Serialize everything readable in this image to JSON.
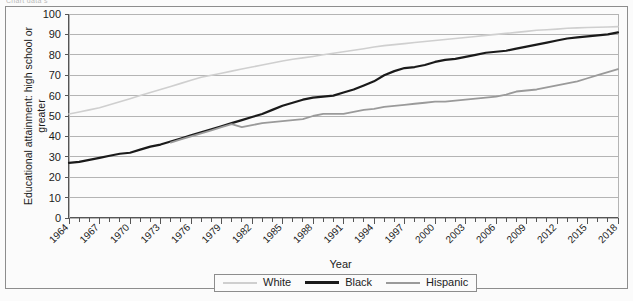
{
  "page": {
    "top_cut_text": "Chart data s"
  },
  "chart_data": {
    "type": "line",
    "title": "",
    "xlabel": "Year",
    "ylabel": "Educational attainment: high school or greater",
    "xlim": [
      1964,
      2018
    ],
    "ylim": [
      0,
      100
    ],
    "ytick_step": 10,
    "xtick_step": 1,
    "xtick_label_step": 3,
    "grid": true,
    "legend_position": "bottom",
    "yticks": [
      0,
      10,
      20,
      30,
      40,
      50,
      60,
      70,
      80,
      90,
      100
    ],
    "xtick_labels": [
      "1964",
      "1967",
      "1970",
      "1973",
      "1976",
      "1979",
      "1982",
      "1985",
      "1988",
      "1991",
      "1994",
      "1997",
      "2000",
      "2003",
      "2006",
      "2009",
      "2012",
      "2015",
      "2018"
    ],
    "colors": {
      "White": "#cfcfcf",
      "Black": "#1a1a1a",
      "Hispanic": "#9a9a9a",
      "grid": "#b4b4b4",
      "axis": "#555555",
      "plot_background": "#fbfbfb"
    },
    "series": [
      {
        "name": "White",
        "color": "#cfcfcf",
        "x": [
          1964,
          1965,
          1966,
          1967,
          1968,
          1969,
          1970,
          1971,
          1972,
          1973,
          1974,
          1975,
          1976,
          1977,
          1978,
          1979,
          1980,
          1981,
          1982,
          1983,
          1984,
          1985,
          1986,
          1987,
          1988,
          1989,
          1990,
          1991,
          1992,
          1993,
          1994,
          1995,
          1996,
          1997,
          1998,
          1999,
          2000,
          2001,
          2002,
          2003,
          2004,
          2005,
          2006,
          2007,
          2008,
          2009,
          2010,
          2011,
          2012,
          2013,
          2014,
          2015,
          2016,
          2017,
          2018
        ],
        "values": [
          51.0,
          52.0,
          53.0,
          54.0,
          55.5,
          57.0,
          58.5,
          60.0,
          61.5,
          63.0,
          64.5,
          66.0,
          67.5,
          69.0,
          70.0,
          71.0,
          72.0,
          73.0,
          74.0,
          75.0,
          76.0,
          77.0,
          77.8,
          78.5,
          79.2,
          80.0,
          80.8,
          81.5,
          82.2,
          83.0,
          83.8,
          84.5,
          85.0,
          85.5,
          86.0,
          86.5,
          87.0,
          87.5,
          88.0,
          88.5,
          89.0,
          89.5,
          90.0,
          90.5,
          91.0,
          91.5,
          92.0,
          92.3,
          92.6,
          93.0,
          93.2,
          93.4,
          93.5,
          93.6,
          93.8
        ]
      },
      {
        "name": "Black",
        "color": "#1a1a1a",
        "x": [
          1964,
          1965,
          1966,
          1967,
          1968,
          1969,
          1970,
          1971,
          1972,
          1973,
          1974,
          1975,
          1976,
          1977,
          1978,
          1979,
          1980,
          1981,
          1982,
          1983,
          1984,
          1985,
          1986,
          1987,
          1988,
          1989,
          1990,
          1991,
          1992,
          1993,
          1994,
          1995,
          1996,
          1997,
          1998,
          1999,
          2000,
          2001,
          2002,
          2003,
          2004,
          2005,
          2006,
          2007,
          2008,
          2009,
          2010,
          2011,
          2012,
          2013,
          2014,
          2015,
          2016,
          2017,
          2018
        ],
        "values": [
          27.0,
          27.5,
          28.5,
          29.5,
          30.5,
          31.5,
          32.0,
          33.5,
          35.0,
          36.0,
          37.5,
          39.0,
          40.5,
          42.0,
          43.5,
          45.0,
          46.5,
          48.0,
          49.5,
          51.0,
          53.0,
          55.0,
          56.5,
          58.0,
          59.0,
          59.5,
          60.0,
          61.5,
          63.0,
          65.0,
          67.0,
          70.0,
          72.0,
          73.5,
          74.0,
          75.0,
          76.5,
          77.5,
          78.0,
          79.0,
          80.0,
          81.0,
          81.5,
          82.0,
          83.0,
          84.0,
          85.0,
          86.0,
          87.0,
          88.0,
          88.5,
          89.0,
          89.5,
          90.0,
          91.0
        ]
      },
      {
        "name": "Hispanic",
        "color": "#9a9a9a",
        "x": [
          1974,
          1975,
          1976,
          1977,
          1978,
          1979,
          1980,
          1981,
          1982,
          1983,
          1984,
          1985,
          1986,
          1987,
          1988,
          1989,
          1990,
          1991,
          1992,
          1993,
          1994,
          1995,
          1996,
          1997,
          1998,
          1999,
          2000,
          2001,
          2002,
          2003,
          2004,
          2005,
          2006,
          2007,
          2008,
          2009,
          2010,
          2011,
          2012,
          2013,
          2014,
          2015,
          2016,
          2017,
          2018
        ],
        "values": [
          37.0,
          38.5,
          40.0,
          41.5,
          43.0,
          44.5,
          46.0,
          44.5,
          45.5,
          46.5,
          47.0,
          47.5,
          48.0,
          48.5,
          50.0,
          51.0,
          51.0,
          51.0,
          52.0,
          53.0,
          53.5,
          54.5,
          55.0,
          55.5,
          56.0,
          56.5,
          57.0,
          57.0,
          57.5,
          58.0,
          58.5,
          59.0,
          59.5,
          60.5,
          62.0,
          62.5,
          63.0,
          64.0,
          65.0,
          66.0,
          67.0,
          68.5,
          70.0,
          71.5,
          73.0
        ]
      }
    ]
  },
  "legend": {
    "items": [
      {
        "label": "White",
        "color": "#cfcfcf",
        "width": 2
      },
      {
        "label": "Black",
        "color": "#1a1a1a",
        "width": 3
      },
      {
        "label": "Hispanic",
        "color": "#9a9a9a",
        "width": 2
      }
    ]
  }
}
